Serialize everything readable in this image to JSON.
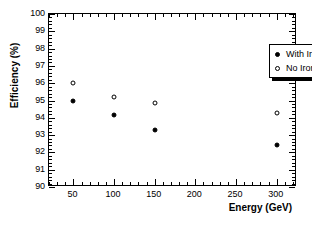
{
  "chart_data": {
    "type": "scatter",
    "title": "",
    "xlabel": "Energy (GeV)",
    "ylabel": "Efficiency (%)",
    "xlim": [
      20,
      325
    ],
    "ylim": [
      90,
      100
    ],
    "grid": false,
    "legend_position": "top-right",
    "x_ticks": [
      50,
      100,
      150,
      200,
      250,
      300
    ],
    "x_tick_labels": [
      "50",
      "100",
      "150",
      "200",
      "250",
      "300"
    ],
    "x_minor_tick_step": 10,
    "y_ticks": [
      90,
      91,
      92,
      93,
      94,
      95,
      96,
      97,
      98,
      99,
      100
    ],
    "y_tick_labels": [
      "90",
      "91",
      "92",
      "93",
      "94",
      "95",
      "96",
      "97",
      "98",
      "99",
      "100"
    ],
    "y_minor_tick_step": 0.2,
    "x": [
      50,
      100,
      150,
      300
    ],
    "series": [
      {
        "name": "With Iron",
        "marker": "filled-circle",
        "color": "#000000",
        "values": [
          95.0,
          94.15,
          93.28,
          92.45
        ]
      },
      {
        "name": "No Iron",
        "marker": "open-circle",
        "color": "#000000",
        "values": [
          96.0,
          95.2,
          94.85,
          94.3
        ]
      }
    ]
  },
  "legend": {
    "entries": [
      {
        "label": "With Iron",
        "marker": "filled-circle"
      },
      {
        "label": "No Iron",
        "marker": "open-circle"
      }
    ]
  },
  "colors": {
    "frame": "#000000",
    "background": "#ffffff",
    "text": "#000000",
    "marker": "#000000"
  }
}
